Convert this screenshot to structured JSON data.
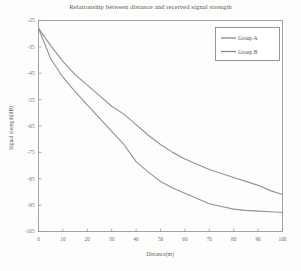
{
  "chart_data": {
    "type": "line",
    "title": "Relationship between distance and received signal strength",
    "xlabel": "Distance(m)",
    "ylabel": "Signal strength(dB)",
    "xlim": [
      0,
      100
    ],
    "ylim": [
      -105,
      -25
    ],
    "xticks": [
      0,
      10,
      20,
      30,
      40,
      50,
      60,
      70,
      80,
      90,
      100
    ],
    "yticks": [
      -25,
      -35,
      -45,
      -55,
      -65,
      -75,
      -85,
      -95,
      -105
    ],
    "xticklabels": [
      "0",
      "10",
      "20",
      "30",
      "40",
      "50",
      "60",
      "70",
      "80",
      "90",
      "100"
    ],
    "yticklabels": [
      "-25",
      "-35",
      "-45",
      "-55",
      "-65",
      "-75",
      "-85",
      "-95",
      "-105"
    ],
    "grid": false,
    "legend_position": "upper right",
    "x": [
      0,
      5,
      10,
      15,
      20,
      25,
      30,
      35,
      40,
      45,
      50,
      55,
      60,
      65,
      70,
      75,
      80,
      85,
      90,
      95,
      100
    ],
    "series": [
      {
        "name": "Group A",
        "color": "#8a8a8a",
        "values": [
          -28.0,
          -34.5,
          -40.5,
          -45.5,
          -49.5,
          -53.5,
          -57.5,
          -60.5,
          -64.5,
          -68.5,
          -72.0,
          -75.0,
          -77.5,
          -79.5,
          -81.5,
          -83.0,
          -84.5,
          -86.0,
          -87.5,
          -89.5,
          -91.0
        ]
      },
      {
        "name": "Group B",
        "color": "#8a8a8a",
        "values": [
          -28.0,
          -39.5,
          -46.5,
          -52.0,
          -57.0,
          -62.0,
          -67.0,
          -72.0,
          -78.5,
          -82.5,
          -86.0,
          -88.5,
          -90.5,
          -92.5,
          -94.5,
          -95.5,
          -96.5,
          -97.0,
          -97.3,
          -97.5,
          -97.8
        ]
      }
    ]
  },
  "legend": {
    "items": [
      {
        "label": "Group A"
      },
      {
        "label": "Group B"
      }
    ]
  }
}
